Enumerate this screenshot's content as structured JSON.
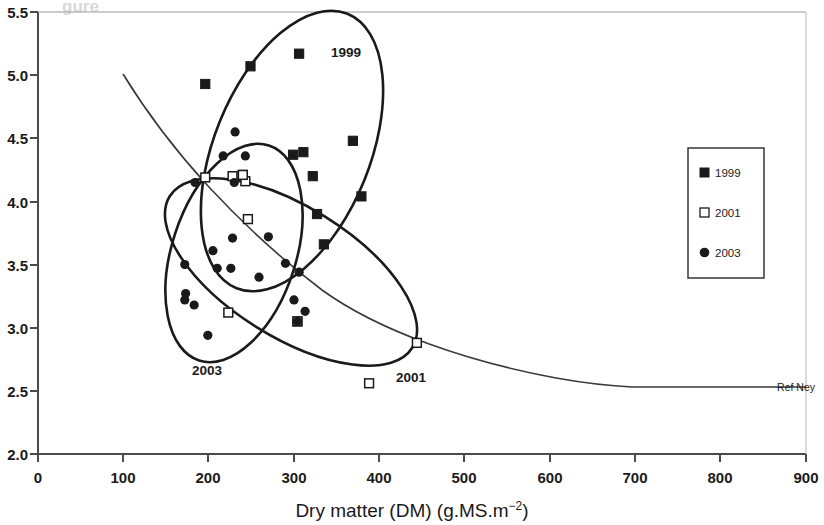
{
  "chart_data": {
    "type": "scatter",
    "title": "",
    "xlabel": "Dry matter (DM) (g.MS.m−2)",
    "ylabel": "",
    "xlim": [
      0,
      900
    ],
    "ylim": [
      2.0,
      5.5
    ],
    "xticks": [
      0,
      100,
      200,
      300,
      400,
      500,
      600,
      700,
      800,
      900
    ],
    "yticks": [
      2.0,
      2.5,
      3.0,
      3.5,
      4.0,
      4.5,
      5.0,
      5.5
    ],
    "xtick_labels": [
      "0",
      "100",
      "200",
      "300",
      "400",
      "500",
      "600",
      "700",
      "800",
      "900"
    ],
    "ytick_labels": [
      "2.0",
      "2.5",
      "3.0",
      "3.5",
      "4.0",
      "4.5",
      "5.0",
      "5.5"
    ],
    "grid": false,
    "legend_position": "right",
    "legend": [
      {
        "label": "1999",
        "marker": "filled-square"
      },
      {
        "label": "2001",
        "marker": "open-square"
      },
      {
        "label": "2003",
        "marker": "filled-circle"
      }
    ],
    "series": [
      {
        "name": "1999",
        "marker": "filled-square",
        "points": [
          [
            196,
            4.93
          ],
          [
            249,
            5.07
          ],
          [
            306,
            5.17
          ],
          [
            299,
            4.37
          ],
          [
            311,
            4.39
          ],
          [
            369,
            4.48
          ],
          [
            322,
            4.2
          ],
          [
            327,
            3.9
          ],
          [
            335,
            3.66
          ],
          [
            304,
            3.05
          ],
          [
            379,
            4.04
          ],
          [
            240,
            4.21
          ]
        ]
      },
      {
        "name": "2001",
        "marker": "open-square",
        "points": [
          [
            196,
            4.19
          ],
          [
            228,
            4.2
          ],
          [
            243,
            4.16
          ],
          [
            246,
            3.86
          ],
          [
            223,
            3.12
          ],
          [
            304,
            3.05
          ],
          [
            444,
            2.88
          ],
          [
            388,
            2.56
          ],
          [
            240,
            4.21
          ]
        ]
      },
      {
        "name": "2003",
        "marker": "filled-circle",
        "points": [
          [
            231,
            4.55
          ],
          [
            217,
            4.36
          ],
          [
            243,
            4.36
          ],
          [
            230,
            4.15
          ],
          [
            184,
            4.15
          ],
          [
            228,
            3.71
          ],
          [
            205,
            3.61
          ],
          [
            172,
            3.5
          ],
          [
            210,
            3.47
          ],
          [
            226,
            3.47
          ],
          [
            270,
            3.72
          ],
          [
            290,
            3.51
          ],
          [
            259,
            3.4
          ],
          [
            306,
            3.44
          ],
          [
            300,
            3.22
          ],
          [
            313,
            3.13
          ],
          [
            173,
            3.27
          ],
          [
            172,
            3.22
          ],
          [
            183,
            3.18
          ],
          [
            199,
            2.94
          ],
          [
            304,
            3.05
          ]
        ]
      }
    ],
    "ellipses": [
      {
        "label": "1999",
        "label_x": 355,
        "label_y": 5.18
      },
      {
        "label": "2001",
        "label_x": 423,
        "label_y": 2.46
      },
      {
        "label": "2003",
        "label_x": 208,
        "label_y": 2.69
      }
    ],
    "reference_curve": {
      "name": "Ref Ney",
      "label": "Ref Ney",
      "points": [
        [
          100,
          5.07
        ],
        [
          150,
          4.62
        ],
        [
          200,
          4.28
        ],
        [
          250,
          4.02
        ],
        [
          300,
          3.8
        ],
        [
          350,
          3.62
        ],
        [
          400,
          3.46
        ],
        [
          450,
          3.32
        ],
        [
          500,
          3.19
        ],
        [
          550,
          3.06
        ],
        [
          600,
          2.93
        ],
        [
          650,
          2.81
        ],
        [
          700,
          2.8
        ],
        [
          750,
          2.8
        ],
        [
          800,
          2.8
        ]
      ],
      "label_x": 812,
      "label_y": 2.8
    },
    "ghost_text": "gure"
  },
  "figure": {
    "x_axis_title": "Dry matter (DM) (g.MS.m",
    "x_axis_title_sup": "−2",
    "x_axis_title_tail": ")",
    "annotations": {
      "a1999": "1999",
      "a2001": "2001",
      "a2003": "2003",
      "ref": "Ref Ney"
    }
  }
}
